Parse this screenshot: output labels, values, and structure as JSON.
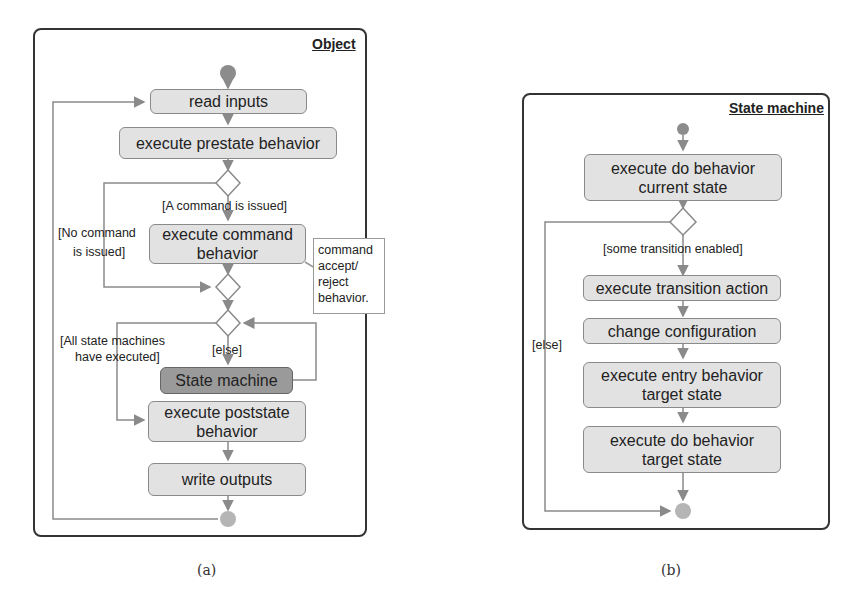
{
  "diagram_a": {
    "frame_title": "Object",
    "nodes": {
      "read_inputs": "read inputs",
      "prestate": "execute prestate behavior",
      "command_1": "execute command",
      "command_2": "behavior",
      "state_machine": "State machine",
      "poststate_1": "execute poststate",
      "poststate_2": "behavior",
      "write_outputs": "write outputs"
    },
    "guards": {
      "command_issued": "[A command is issued]",
      "no_command_1": "[No command",
      "no_command_2": "is issued]",
      "all_executed_1": "[All state machines",
      "all_executed_2": "have executed]",
      "else": "[else]"
    },
    "note": {
      "line1": "command",
      "line2": "accept/",
      "line3": "reject",
      "line4": "behavior."
    },
    "caption": "(a)"
  },
  "diagram_b": {
    "frame_title": "State machine",
    "nodes": {
      "do_current_1": "execute do behavior",
      "do_current_2": "current state",
      "transition_action": "execute transition action",
      "change_config": "change configuration",
      "entry_target_1": "execute entry behavior",
      "entry_target_2": "target state",
      "do_target_1": "execute do behavior",
      "do_target_2": "target state"
    },
    "guards": {
      "some_enabled": "[some transition enabled]",
      "else": "[else]"
    },
    "caption": "(b)"
  },
  "colors": {
    "action_fill": "#e2e2e2",
    "state_machine_fill": "#9a9a9a",
    "edge": "#8a8a8a",
    "initial_node": "#8c8c8c",
    "final_node": "#b5b5b5",
    "frame_border": "#333333"
  }
}
